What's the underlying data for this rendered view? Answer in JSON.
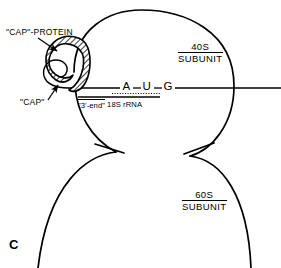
{
  "figure": {
    "panel_letter": "C",
    "line_color": "#000000",
    "background_color": "#ffffff",
    "hatch_color": "#000000"
  },
  "labels": {
    "cap_protein": "\"CAP\"-PROTEIN",
    "cap": "\"CAP\"",
    "rrna_end": "\"3'-end\"",
    "rrna_name": "18S rRNA"
  },
  "subunits": [
    {
      "size": "40S",
      "word": "SUBUNIT"
    },
    {
      "size": "60S",
      "word": "SUBUNIT"
    }
  ],
  "codon": {
    "base_1": "A",
    "base_2": "U",
    "base_3": "G"
  }
}
